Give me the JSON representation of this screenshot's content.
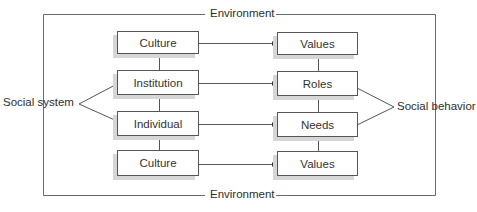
{
  "diagram": {
    "type": "social-systems-model",
    "frame_label_top": "Environment",
    "frame_label_bottom": "Environment",
    "left_group_label": "Social system",
    "right_group_label": "Social behavior",
    "left_column": [
      {
        "label": "Culture"
      },
      {
        "label": "Institution"
      },
      {
        "label": "Individual"
      },
      {
        "label": "Culture"
      }
    ],
    "right_column": [
      {
        "label": "Values"
      },
      {
        "label": "Roles"
      },
      {
        "label": "Needs"
      },
      {
        "label": "Values"
      }
    ],
    "connections": [
      {
        "from": "Culture",
        "to": "Values",
        "type": "arrow"
      },
      {
        "from": "Institution",
        "to": "Roles",
        "type": "arrow"
      },
      {
        "from": "Individual",
        "to": "Needs",
        "type": "arrow"
      },
      {
        "from": "Culture",
        "to": "Values",
        "type": "arrow"
      }
    ],
    "colors": {
      "line": "#555555",
      "box_border": "#555555",
      "shadow": "#d6d6d6",
      "text": "#333333"
    }
  }
}
